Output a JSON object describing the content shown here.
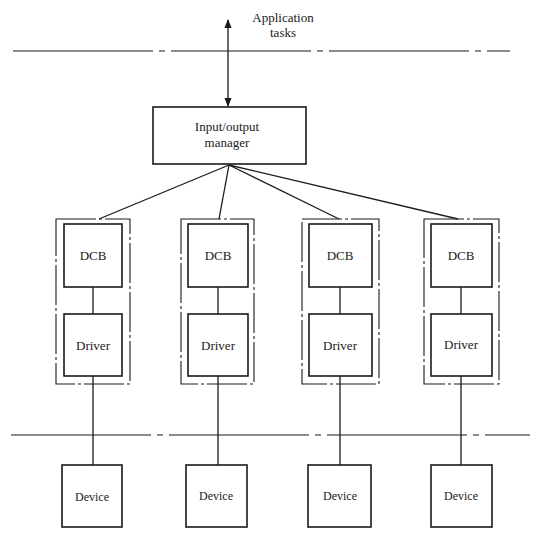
{
  "diagram": {
    "top_label_line1": "Application",
    "top_label_line2": "tasks",
    "manager_line1": "Input/output",
    "manager_line2": "manager",
    "columns": [
      {
        "dcb": "DCB",
        "driver": "Driver",
        "device": "Device"
      },
      {
        "dcb": "DCB",
        "driver": "Driver",
        "device": "Device"
      },
      {
        "dcb": "DCB",
        "driver": "Driver",
        "device": "Device"
      },
      {
        "dcb": "DCB",
        "driver": "Driver",
        "device": "Device"
      }
    ],
    "colors": {
      "stroke": "#1a1a1a",
      "background": "#ffffff"
    }
  }
}
